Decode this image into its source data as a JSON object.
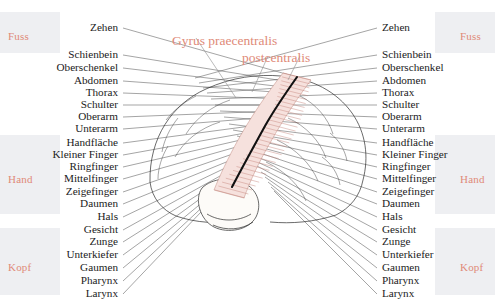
{
  "figure": {
    "title_lines": [
      {
        "text": "Gyrus praecentralis",
        "x": 172,
        "y": 33
      },
      {
        "text": "postcentralis",
        "x": 242,
        "y": 50
      }
    ],
    "accent_color": "#e08a78",
    "band_color": "#e7e9ed",
    "sulcus_color": "#111111"
  },
  "groups": [
    {
      "name": "Fuss",
      "left_x": 8,
      "right_x": 460,
      "y": 30,
      "band_top": 12,
      "band_height": 41
    },
    {
      "name": "Hand",
      "left_x": 8,
      "right_x": 460,
      "y": 173,
      "band_top": 135,
      "band_height": 79
    },
    {
      "name": "Kopf",
      "left_x": 8,
      "right_x": 460,
      "y": 261,
      "band_top": 228,
      "band_height": 67
    }
  ],
  "parts": [
    {
      "label": "Zehen",
      "y": 22,
      "left_right_edge": 118,
      "right_left_edge": 382,
      "tip_x": 300,
      "tip_y": 78
    },
    {
      "label": "Schienbein",
      "y": 49,
      "left_right_edge": 118,
      "right_left_edge": 382,
      "tip_x": 296,
      "tip_y": 83
    },
    {
      "label": "Oberschenkel",
      "y": 62,
      "left_right_edge": 118,
      "right_left_edge": 382,
      "tip_x": 292,
      "tip_y": 88
    },
    {
      "label": "Abdomen",
      "y": 75,
      "left_right_edge": 118,
      "right_left_edge": 382,
      "tip_x": 288,
      "tip_y": 93
    },
    {
      "label": "Thorax",
      "y": 87,
      "left_right_edge": 118,
      "right_left_edge": 382,
      "tip_x": 284,
      "tip_y": 99
    },
    {
      "label": "Schulter",
      "y": 99,
      "left_right_edge": 118,
      "right_left_edge": 382,
      "tip_x": 280,
      "tip_y": 105
    },
    {
      "label": "Oberarm",
      "y": 111,
      "left_right_edge": 118,
      "right_left_edge": 382,
      "tip_x": 275,
      "tip_y": 111
    },
    {
      "label": "Unterarm",
      "y": 123,
      "left_right_edge": 118,
      "right_left_edge": 382,
      "tip_x": 271,
      "tip_y": 117
    },
    {
      "label": "Handfläche",
      "y": 137,
      "left_right_edge": 118,
      "right_left_edge": 382,
      "tip_x": 266,
      "tip_y": 124
    },
    {
      "label": "Kleiner Finger",
      "y": 149,
      "left_right_edge": 118,
      "right_left_edge": 382,
      "tip_x": 262,
      "tip_y": 130
    },
    {
      "label": "Ringfinger",
      "y": 161,
      "left_right_edge": 118,
      "right_left_edge": 382,
      "tip_x": 258,
      "tip_y": 136
    },
    {
      "label": "Mittelfinger",
      "y": 173,
      "left_right_edge": 118,
      "right_left_edge": 382,
      "tip_x": 254,
      "tip_y": 142
    },
    {
      "label": "Zeigefinger",
      "y": 186,
      "left_right_edge": 118,
      "right_left_edge": 382,
      "tip_x": 250,
      "tip_y": 148
    },
    {
      "label": "Daumen",
      "y": 198,
      "left_right_edge": 118,
      "right_left_edge": 382,
      "tip_x": 246,
      "tip_y": 154
    },
    {
      "label": "Hals",
      "y": 211,
      "left_right_edge": 118,
      "right_left_edge": 382,
      "tip_x": 242,
      "tip_y": 160
    },
    {
      "label": "Gesicht",
      "y": 224,
      "left_right_edge": 118,
      "right_left_edge": 382,
      "tip_x": 238,
      "tip_y": 166
    },
    {
      "label": "Zunge",
      "y": 236,
      "left_right_edge": 118,
      "right_left_edge": 382,
      "tip_x": 234,
      "tip_y": 172
    },
    {
      "label": "Unterkiefer",
      "y": 249,
      "left_right_edge": 118,
      "right_left_edge": 382,
      "tip_x": 230,
      "tip_y": 177
    },
    {
      "label": "Gaumen",
      "y": 262,
      "left_right_edge": 118,
      "right_left_edge": 382,
      "tip_x": 227,
      "tip_y": 182
    },
    {
      "label": "Pharynx",
      "y": 275,
      "left_right_edge": 118,
      "right_left_edge": 382,
      "tip_x": 224,
      "tip_y": 187
    },
    {
      "label": "Larynx",
      "y": 288,
      "left_right_edge": 118,
      "right_left_edge": 382,
      "tip_x": 221,
      "tip_y": 191
    }
  ]
}
